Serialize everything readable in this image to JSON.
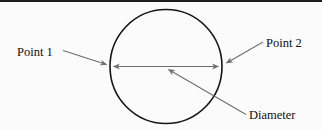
{
  "figure": {
    "background_color": "#fbfbfb",
    "border": {
      "name": "top-rule",
      "color": "#1c1c22",
      "thickness_px": 2,
      "position": "top"
    },
    "shape": {
      "type": "circle",
      "stroke_color": "#151515",
      "stroke_width_px": 1.6,
      "fill": "none",
      "center": {
        "x": 166,
        "y": 66.5
      },
      "radius_x": 56,
      "radius_y": 57
    },
    "measure_line": {
      "name": "diameter-arrow",
      "color": "#6e6e6e",
      "from": {
        "x": 110,
        "y": 66.5
      },
      "to": {
        "x": 222,
        "y": 66.5
      },
      "arrowheads": "both"
    },
    "labels": [
      {
        "id": "point-1",
        "text": "Point 1",
        "x": 17,
        "y": 56,
        "leader_color": "#6e6e6e",
        "leader_from": {
          "x": 63,
          "y": 51
        },
        "leader_to": {
          "x": 109,
          "y": 65
        }
      },
      {
        "id": "point-2",
        "text": "Point 2",
        "x": 266,
        "y": 47,
        "leader_color": "#6e6e6e",
        "leader_from": {
          "x": 262,
          "y": 43
        },
        "leader_to": {
          "x": 224,
          "y": 64
        }
      },
      {
        "id": "diameter",
        "text": "Diameter",
        "x": 249,
        "y": 119,
        "leader_color": "#6e6e6e",
        "leader_from": {
          "x": 245,
          "y": 115
        },
        "leader_to": {
          "x": 166,
          "y": 69
        }
      }
    ]
  }
}
